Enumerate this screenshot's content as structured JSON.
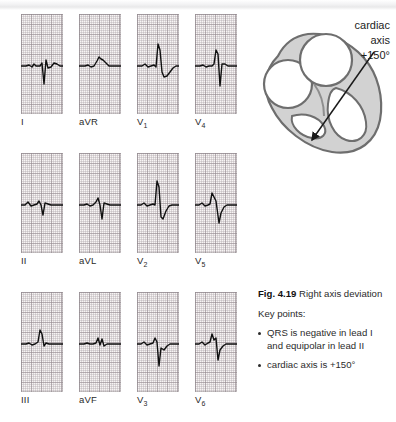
{
  "figure": {
    "number": "Fig. 4.19",
    "title": "Right axis deviation",
    "key_points_label": "Key points:",
    "key_points": [
      "QRS is negative in lead I and equipolar in lead II",
      "cardiac axis is +150°"
    ]
  },
  "diagram": {
    "axis_label_line1": "cardiac",
    "axis_label_line2": "axis",
    "axis_value": "+150°",
    "arrow_name": "cardiac-axis-arrow",
    "heart_fill": "#cfcfcf",
    "heart_stroke": "#6e6e6e"
  },
  "ecg": {
    "grid_minor_color": "#afa8ac",
    "grid_major_color": "#968c91",
    "paper_color": "#f7f4f4",
    "trace_color": "#101010",
    "rows": [
      {
        "row_name": "limb-leads-row-1",
        "leads": [
          {
            "label": "I",
            "sub": "",
            "trace": "M0,52 L5,52 L8,51 L11,53 L13,50 L15,52 L19,52 L21,49 L23,70 L25,46 L27,54 L30,53 L33,49 L36,50 L39,52 L42,52"
          },
          {
            "label": "aVR",
            "sub": "",
            "trace": "M0,52 L6,52 L9,51 L12,53 L15,52 L18,47 L20,43 L22,45 L24,46 L27,49 L30,52 L34,52 L38,52 L42,52"
          },
          {
            "label": "V",
            "sub": "1",
            "trace": "M0,52 L5,52 L8,50 L11,53 L14,52 L17,51 L19,53 L21,30 L23,36 L25,58 L27,63 L30,62 L33,58 L36,54 L39,52 L42,52"
          },
          {
            "label": "V",
            "sub": "4",
            "trace": "M0,52 L5,52 L8,51 L11,53 L14,52 L17,52 L19,50 L21,36 L23,40 L25,72 L27,50 L30,50 L33,52 L36,52 L39,52 L42,52"
          }
        ]
      },
      {
        "row_name": "limb-leads-row-2",
        "leads": [
          {
            "label": "II",
            "sub": "",
            "trace": "M0,52 L4,52 L7,49 L10,53 L13,52 L16,51 L18,48 L20,52 L22,62 L24,50 L27,51 L30,52 L34,52 L38,52 L42,52"
          },
          {
            "label": "aVL",
            "sub": "",
            "trace": "M0,52 L5,52 L8,51 L11,53 L14,52 L17,49 L19,45 L21,52 L23,66 L25,50 L28,51 L31,52 L35,52 L38,52 L42,52"
          },
          {
            "label": "V",
            "sub": "2",
            "trace": "M0,52 L4,52 L7,50 L10,53 L13,52 L16,51 L18,52 L20,28 L22,34 L24,64 L26,66 L29,58 L32,53 L35,52 L38,52 L42,52"
          },
          {
            "label": "V",
            "sub": "5",
            "trace": "M0,52 L4,52 L7,50 L10,53 L13,52 L15,51 L17,40 L19,44 L21,48 L24,70 L26,60 L29,54 L32,52 L36,52 L42,52"
          }
        ]
      },
      {
        "row_name": "limb-leads-row-3",
        "leads": [
          {
            "label": "III",
            "sub": "",
            "trace": "M0,52 L5,52 L8,51 L11,53 L14,52 L17,50 L19,38 L21,42 L23,54 L25,51 L28,52 L32,52 L36,52 L42,52"
          },
          {
            "label": "aVF",
            "sub": "",
            "trace": "M0,52 L5,52 L8,51 L11,52 L14,52 L17,51 L19,46 L21,53 L23,47 L25,54 L28,52 L32,52 L36,52 L42,52"
          },
          {
            "label": "V",
            "sub": "3",
            "trace": "M0,52 L4,52 L7,50 L10,53 L13,52 L16,51 L18,46 L20,50 L22,74 L24,56 L27,58 L30,54 L33,52 L37,52 L42,52"
          },
          {
            "label": "V",
            "sub": "6",
            "trace": "M0,52 L4,52 L7,50 L10,53 L13,51 L15,50 L17,42 L19,48 L21,46 L23,68 L25,58 L28,54 L31,52 L35,52 L42,52"
          }
        ]
      }
    ]
  }
}
